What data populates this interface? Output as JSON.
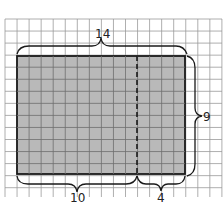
{
  "diagram": {
    "grid": {
      "cols": 18,
      "rows": 15,
      "cell": 12.1
    },
    "rectangle": {
      "width_units": 14,
      "height_units": 9,
      "fill": "#b9b9b9"
    },
    "split": {
      "left_units": 10,
      "right_units": 4
    },
    "labels": {
      "top": "14",
      "right": "9",
      "bottom_left": "10",
      "bottom_right": "4"
    }
  }
}
